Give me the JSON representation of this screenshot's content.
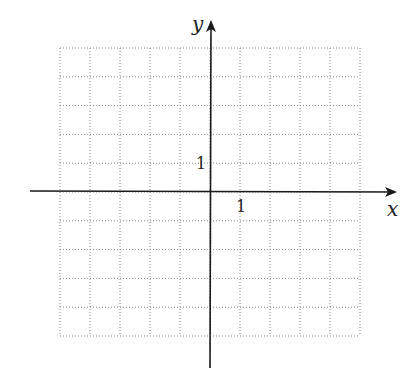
{
  "chart_data": {
    "type": "scatter",
    "title": "",
    "xlabel": "x",
    "ylabel": "y",
    "xlim": [
      -5,
      5
    ],
    "ylim": [
      -5,
      5
    ],
    "grid": true,
    "grid_style": "dotted",
    "tick_labels": {
      "x": "1",
      "y": "1"
    },
    "series": []
  },
  "axes": {
    "x_label": "x",
    "y_label": "y",
    "x_tick_label": "1",
    "y_tick_label": "1"
  },
  "colors": {
    "axis": "#1a1a1a",
    "grid": "#8a8a8a",
    "background": "#ffffff"
  }
}
